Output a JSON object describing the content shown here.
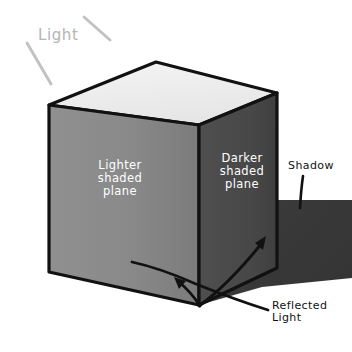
{
  "diagram": {
    "type": "isometric-cube-shading-illustration"
  },
  "labels": {
    "light": "Light",
    "lighter_plane": "Lighter\nshaded\nplane",
    "darker_plane": "Darker\nshaded\nplane",
    "shadow": "Shadow",
    "reflected_light": "Reflected\nLight"
  },
  "colors": {
    "background": "#ffffff",
    "top_face": "#efefef",
    "left_face": "#8a8a8a",
    "left_face_dark": "#7e7e7e",
    "right_face": "#4a4a4a",
    "right_face_dark": "#3f3f3f",
    "shadow": "#3a3a3a",
    "outline": "#111111",
    "label_text_on_face": "#ffffff",
    "label_text_side": "#111111",
    "light_ray": "#c0c0c0",
    "light_text": "#b4b4b4"
  },
  "geometry": {
    "top_face": "49,105 156,62 277,93 199,125",
    "left_face": "49,105 199,125 199,305 49,272",
    "right_face": "199,125 277,93 277,268 199,305",
    "shadow_polygon": "277,200 352,200 352,278 258,288 199,305 277,268"
  },
  "icons": {
    "light_ray_left": "diagonal-ray",
    "light_ray_right": "diagonal-ray",
    "arrow_reflected_left": "arrow-up-left",
    "arrow_reflected_right": "arrow-up-right",
    "leader_shadow": "leader-line"
  }
}
